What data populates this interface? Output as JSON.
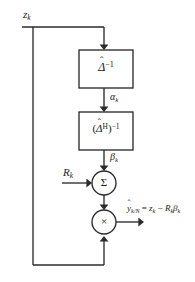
{
  "diagram": {
    "background_color": "#ffffff",
    "line_color": "#2b2b2b",
    "text_color": "#1a1a1a",
    "width": 195,
    "height": 282,
    "input_label": "z",
    "input_subscript": "k",
    "intermediate_1_label": "α",
    "intermediate_1_subscript": "k",
    "intermediate_2_label": "β",
    "intermediate_2_subscript": "k",
    "side_input_label": "R",
    "side_input_subscript": "k",
    "blocks": [
      {
        "id": "block-delta-inv",
        "base": "Δ",
        "hat": "ˆ",
        "exponent": "−1",
        "plain": "Δ̂⁻¹"
      },
      {
        "id": "block-delta-h-inv",
        "base": "Δ",
        "hat": "ˆ",
        "superscript_inner": "H",
        "exponent": "−1",
        "plain": "(Δ̂^H)⁻¹"
      }
    ],
    "operators": [
      {
        "id": "summing-junction",
        "glyph": "Σ",
        "name": "sigma"
      },
      {
        "id": "product-junction",
        "glyph": "×",
        "name": "multiply"
      }
    ],
    "output": {
      "lhs_base": "y",
      "lhs_hat": "ˆ",
      "lhs_subscript": "k/N",
      "equals": "=",
      "rhs_term1_base": "z",
      "rhs_term1_subscript": "k",
      "minus": "−",
      "rhs_term2_base": "R",
      "rhs_term2_subscript": "k",
      "rhs_term3_base": "β",
      "rhs_term3_subscript": "k",
      "plain": "ŷ k/N = z k − R k β k"
    }
  }
}
